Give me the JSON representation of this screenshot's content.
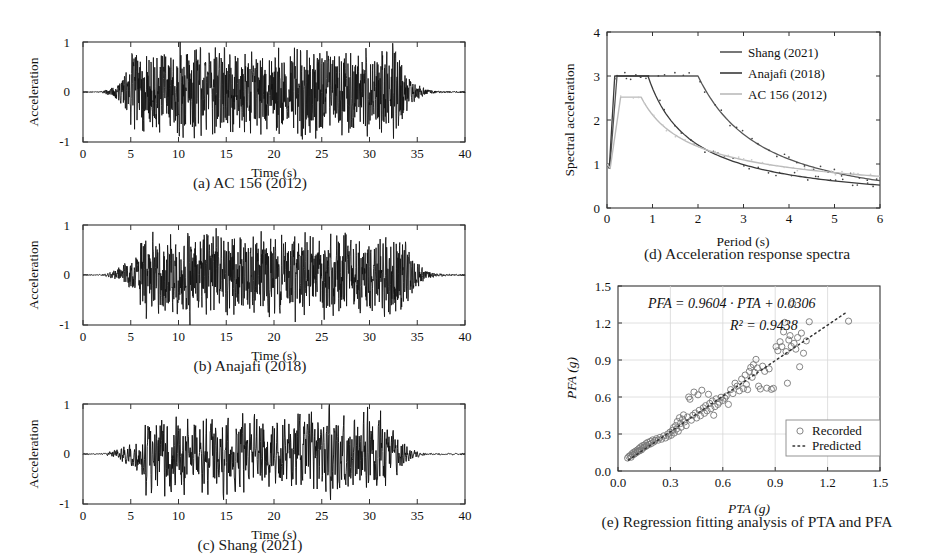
{
  "figure": {
    "panels": [
      {
        "id": "a",
        "caption": "(a) AC 156 (2012)"
      },
      {
        "id": "b",
        "caption": "(b) Anajafi (2018)"
      },
      {
        "id": "c",
        "caption": "(c) Shang (2021)"
      },
      {
        "id": "d",
        "caption": "(d) Acceleration response spectra"
      },
      {
        "id": "e",
        "caption": "(e) Regression fitting analysis of PTA and PFA"
      }
    ]
  },
  "colors": {
    "ink": "#111111",
    "grid": "#cccccc",
    "axis": "#444444",
    "shang": "#555555",
    "anajafi": "#3a3a3a",
    "ac156": "#bbbbbb",
    "marker": "#777777",
    "predicted": "#333333"
  },
  "chart_data": [
    {
      "type": "line",
      "panel": "a",
      "title": "(a) AC 156 (2012)",
      "xlabel": "Time (s)",
      "ylabel": "Acceleration",
      "xlim": [
        0,
        40
      ],
      "ylim": [
        -1,
        1
      ],
      "xticks": [
        0,
        5,
        10,
        15,
        20,
        25,
        30,
        35,
        40
      ],
      "yticks": [
        -1,
        0,
        1
      ],
      "grid": false,
      "series_name": "AC 156 (2012) ground motion",
      "envelope": {
        "rise_end": 5.0,
        "strong_end": 33.0,
        "decay_end": 40.0,
        "peak": 1.0
      },
      "seed": 11,
      "n_points": 1400,
      "roughness": 0.62
    },
    {
      "type": "line",
      "panel": "b",
      "title": "(b) Anajafi (2018)",
      "xlabel": "Time (s)",
      "ylabel": "Acceleration",
      "xlim": [
        0,
        40
      ],
      "ylim": [
        -1,
        1
      ],
      "xticks": [
        0,
        5,
        10,
        15,
        20,
        25,
        30,
        35,
        40
      ],
      "yticks": [
        -1,
        0,
        1
      ],
      "grid": false,
      "series_name": "Anajafi (2018) ground motion",
      "envelope": {
        "rise_end": 6.0,
        "strong_end": 33.5,
        "decay_end": 40.0,
        "peak": 1.0
      },
      "seed": 29,
      "n_points": 1400,
      "roughness": 0.5
    },
    {
      "type": "line",
      "panel": "c",
      "title": "(c) Shang (2021)",
      "xlabel": "Time (s)",
      "ylabel": "Acceleration",
      "xlim": [
        0,
        40
      ],
      "ylim": [
        -1,
        1
      ],
      "xticks": [
        0,
        5,
        10,
        15,
        20,
        25,
        30,
        35,
        40
      ],
      "yticks": [
        -1,
        0,
        1
      ],
      "grid": false,
      "series_name": "Shang (2021) ground motion",
      "envelope": {
        "rise_end": 6.5,
        "strong_end": 32.0,
        "decay_end": 40.0,
        "peak": 1.0
      },
      "seed": 47,
      "n_points": 1000,
      "roughness": 0.33
    },
    {
      "type": "line",
      "panel": "d",
      "title": "(d) Acceleration response spectra",
      "xlabel": "Period (s)",
      "ylabel": "Spectral acceleration",
      "xlim": [
        0,
        6
      ],
      "ylim": [
        0,
        4
      ],
      "xticks": [
        0,
        1,
        2,
        3,
        4,
        5,
        6
      ],
      "yticks": [
        0,
        1,
        2,
        3,
        4
      ],
      "grid": false,
      "legend_position": "top-right",
      "series": [
        {
          "name": "Shang (2021)",
          "color": "#555555",
          "plateau": 3.0,
          "t_start": 0.06,
          "t_plateau": 0.22,
          "t_corner": 2.0,
          "t_end": 6.0,
          "end_value": 0.62,
          "zero_value": 1.0,
          "dotted": true
        },
        {
          "name": "Anajafi (2018)",
          "color": "#3a3a3a",
          "plateau": 3.0,
          "t_start": 0.05,
          "t_plateau": 0.17,
          "t_corner": 0.9,
          "t_end": 6.0,
          "end_value": 0.52,
          "zero_value": 1.0,
          "dotted": true
        },
        {
          "name": "AC 156 (2012)",
          "color": "#bbbbbb",
          "plateau": 2.52,
          "t_start": 0.07,
          "t_plateau": 0.3,
          "t_corner": 0.75,
          "t_end": 6.0,
          "end_value": 0.72,
          "zero_value": 1.0,
          "dotted": true
        }
      ]
    },
    {
      "type": "scatter",
      "panel": "e",
      "title": "(e) Regression fitting analysis of PTA and PFA",
      "xlabel": "PTA (g)",
      "ylabel": "PFA (g)",
      "xlim": [
        0,
        1.5
      ],
      "ylim": [
        0,
        1.5
      ],
      "xticks": [
        "0.0",
        "0.3",
        "0.6",
        "0.9",
        "1.2",
        "1.5"
      ],
      "yticks": [
        "0.0",
        "0.3",
        "0.6",
        "0.9",
        "1.2",
        "1.5"
      ],
      "grid": true,
      "annotations": [
        "PFA = 0.9604 · PTA + 0.0306",
        "R² = 0.9438"
      ],
      "equation_slope": 0.9604,
      "equation_intercept": 0.0306,
      "r_squared": 0.9438,
      "legend": [
        {
          "label": "Recorded",
          "marker": "open-circle"
        },
        {
          "label": "Predicted",
          "marker": "dotted-line"
        }
      ],
      "points": [
        [
          0.055,
          0.105
        ],
        [
          0.062,
          0.118
        ],
        [
          0.07,
          0.125
        ],
        [
          0.075,
          0.112
        ],
        [
          0.08,
          0.14
        ],
        [
          0.085,
          0.13
        ],
        [
          0.09,
          0.152
        ],
        [
          0.095,
          0.138
        ],
        [
          0.1,
          0.16
        ],
        [
          0.105,
          0.148
        ],
        [
          0.11,
          0.17
        ],
        [
          0.115,
          0.158
        ],
        [
          0.12,
          0.182
        ],
        [
          0.125,
          0.165
        ],
        [
          0.13,
          0.195
        ],
        [
          0.135,
          0.172
        ],
        [
          0.14,
          0.205
        ],
        [
          0.145,
          0.188
        ],
        [
          0.15,
          0.21
        ],
        [
          0.155,
          0.196
        ],
        [
          0.16,
          0.222
        ],
        [
          0.165,
          0.205
        ],
        [
          0.17,
          0.232
        ],
        [
          0.178,
          0.215
        ],
        [
          0.185,
          0.24
        ],
        [
          0.19,
          0.222
        ],
        [
          0.198,
          0.252
        ],
        [
          0.205,
          0.235
        ],
        [
          0.212,
          0.248
        ],
        [
          0.22,
          0.262
        ],
        [
          0.23,
          0.25
        ],
        [
          0.24,
          0.272
        ],
        [
          0.25,
          0.258
        ],
        [
          0.262,
          0.285
        ],
        [
          0.272,
          0.268
        ],
        [
          0.285,
          0.3
        ],
        [
          0.29,
          0.282
        ],
        [
          0.298,
          0.315
        ],
        [
          0.305,
          0.29
        ],
        [
          0.312,
          0.33
        ],
        [
          0.318,
          0.352
        ],
        [
          0.322,
          0.308
        ],
        [
          0.33,
          0.368
        ],
        [
          0.335,
          0.34
        ],
        [
          0.34,
          0.402
        ],
        [
          0.345,
          0.322
        ],
        [
          0.352,
          0.432
        ],
        [
          0.358,
          0.385
        ],
        [
          0.362,
          0.355
        ],
        [
          0.37,
          0.42
        ],
        [
          0.375,
          0.455
        ],
        [
          0.382,
          0.398
        ],
        [
          0.39,
          0.368
        ],
        [
          0.398,
          0.438
        ],
        [
          0.405,
          0.6
        ],
        [
          0.412,
          0.582
        ],
        [
          0.42,
          0.412
        ],
        [
          0.428,
          0.452
        ],
        [
          0.435,
          0.64
        ],
        [
          0.442,
          0.47
        ],
        [
          0.45,
          0.43
        ],
        [
          0.458,
          0.618
        ],
        [
          0.465,
          0.492
        ],
        [
          0.472,
          0.448
        ],
        [
          0.48,
          0.655
        ],
        [
          0.488,
          0.512
        ],
        [
          0.495,
          0.468
        ],
        [
          0.502,
          0.53
        ],
        [
          0.51,
          0.488
        ],
        [
          0.518,
          0.622
        ],
        [
          0.525,
          0.548
        ],
        [
          0.532,
          0.505
        ],
        [
          0.54,
          0.568
        ],
        [
          0.548,
          0.452
        ],
        [
          0.555,
          0.522
        ],
        [
          0.562,
          0.585
        ],
        [
          0.572,
          0.54
        ],
        [
          0.58,
          0.558
        ],
        [
          0.59,
          0.598
        ],
        [
          0.6,
          0.572
        ],
        [
          0.612,
          0.59
        ],
        [
          0.62,
          0.608
        ],
        [
          0.632,
          0.54
        ],
        [
          0.645,
          0.66
        ],
        [
          0.658,
          0.628
        ],
        [
          0.67,
          0.712
        ],
        [
          0.682,
          0.688
        ],
        [
          0.695,
          0.65
        ],
        [
          0.708,
          0.745
        ],
        [
          0.718,
          0.668
        ],
        [
          0.728,
          0.778
        ],
        [
          0.735,
          0.702
        ],
        [
          0.742,
          0.66
        ],
        [
          0.752,
          0.808
        ],
        [
          0.76,
          0.84
        ],
        [
          0.768,
          0.76
        ],
        [
          0.775,
          0.862
        ],
        [
          0.782,
          0.8
        ],
        [
          0.79,
          0.905
        ],
        [
          0.798,
          0.835
        ],
        [
          0.805,
          0.688
        ],
        [
          0.815,
          0.665
        ],
        [
          0.828,
          0.85
        ],
        [
          0.84,
          0.808
        ],
        [
          0.852,
          0.672
        ],
        [
          0.865,
          0.828
        ],
        [
          0.878,
          0.662
        ],
        [
          0.89,
          0.67
        ],
        [
          0.905,
          1.008
        ],
        [
          0.915,
          0.975
        ],
        [
          0.928,
          1.048
        ],
        [
          0.938,
          1.008
        ],
        [
          0.948,
          1.128
        ],
        [
          0.955,
          1.205
        ],
        [
          0.962,
          0.968
        ],
        [
          0.97,
          0.712
        ],
        [
          0.978,
          1.062
        ],
        [
          0.985,
          1.098
        ],
        [
          0.992,
          1.01
        ],
        [
          1.0,
          1.358
        ],
        [
          1.008,
          1.035
        ],
        [
          1.018,
          0.988
        ],
        [
          1.028,
          1.082
        ],
        [
          1.04,
          0.845
        ],
        [
          1.05,
          1.118
        ],
        [
          1.062,
          0.955
        ],
        [
          1.078,
          1.055
        ],
        [
          1.095,
          1.21
        ],
        [
          1.32,
          1.215
        ]
      ]
    }
  ]
}
